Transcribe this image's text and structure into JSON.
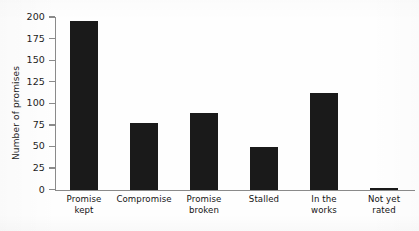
{
  "chart_data": {
    "type": "bar",
    "title": "",
    "xlabel": "",
    "ylabel": "Number of promises",
    "categories": [
      "Promise kept",
      "Compromise",
      "Promise broken",
      "Stalled",
      "In the works",
      "Not yet rated"
    ],
    "category_lines": [
      [
        "Promise",
        "kept"
      ],
      [
        "Compromise"
      ],
      [
        "Promise",
        "broken"
      ],
      [
        "Stalled"
      ],
      [
        "In the",
        "works"
      ],
      [
        "Not yet",
        "rated"
      ]
    ],
    "values": [
      195,
      77,
      89,
      49,
      112,
      2
    ],
    "ylim": [
      0,
      200
    ],
    "yticks": [
      0,
      25,
      50,
      75,
      100,
      125,
      150,
      175,
      200
    ],
    "ytick_labels": [
      "0",
      "25",
      "50",
      "75",
      "100",
      "125",
      "150",
      "175",
      "200"
    ],
    "grid": false,
    "legend": false,
    "bar_color": "#1a1a1a",
    "axis_color": "#8a8a8a",
    "background_color": "#fefefe"
  }
}
